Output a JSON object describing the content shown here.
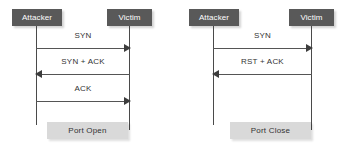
{
  "canvas": {
    "width": 351,
    "height": 149,
    "background": "#ffffff"
  },
  "colors": {
    "actor_box": "#595959",
    "actor_text": "#ffffff",
    "lifeline": "#4a4a4a",
    "arrow": "#3d3d3d",
    "message_text": "#333333",
    "result_box": "#d9d9d9",
    "result_text": "#333333"
  },
  "diagrams": [
    {
      "id": "port-open",
      "actors": [
        {
          "name": "attacker",
          "label": "Attacker"
        },
        {
          "name": "victim",
          "label": "Victim"
        }
      ],
      "messages": [
        {
          "label": "SYN",
          "direction": "right"
        },
        {
          "label": "SYN + ACK",
          "direction": "left"
        },
        {
          "label": "ACK",
          "direction": "right"
        }
      ],
      "result": {
        "label": "Port Open"
      }
    },
    {
      "id": "port-close",
      "actors": [
        {
          "name": "attacker",
          "label": "Attacker"
        },
        {
          "name": "victim",
          "label": "Victim"
        }
      ],
      "messages": [
        {
          "label": "SYN",
          "direction": "right"
        },
        {
          "label": "RST + ACK",
          "direction": "left"
        }
      ],
      "result": {
        "label": "Port Close"
      }
    }
  ]
}
